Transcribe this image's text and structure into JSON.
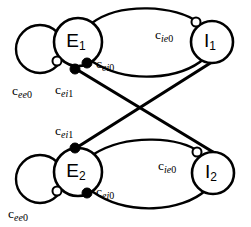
{
  "figure": {
    "background_color": "#ffffff",
    "stroke_color": "#000000",
    "width": 251,
    "height": 227
  },
  "nodes": [
    {
      "id": "E1",
      "base": "E",
      "subscript": "1",
      "cx": 78,
      "cy": 42,
      "r": 24,
      "type": "excitatory"
    },
    {
      "id": "I1",
      "base": "I",
      "subscript": "1",
      "cx": 212,
      "cy": 42,
      "r": 21,
      "type": "inhibitory"
    },
    {
      "id": "E2",
      "base": "E",
      "subscript": "2",
      "cx": 78,
      "cy": 172,
      "r": 24,
      "type": "excitatory"
    },
    {
      "id": "I2",
      "base": "I",
      "subscript": "2",
      "cx": 213,
      "cy": 173,
      "r": 21,
      "type": "inhibitory"
    }
  ],
  "edge_labels": [
    {
      "id": "cee0-top",
      "base": "c",
      "italic_sub": "ee",
      "num_sub": "0",
      "x": 12,
      "y": 95,
      "for": "E1-self-loop"
    },
    {
      "id": "cei0-top",
      "base": "c",
      "italic_sub": "ei",
      "num_sub": "0",
      "x": 96,
      "y": 68,
      "for": "E1-to-I1"
    },
    {
      "id": "cei1-top",
      "base": "c",
      "italic_sub": "ei",
      "num_sub": "1",
      "x": 55,
      "y": 94,
      "for": "E1-to-I2"
    },
    {
      "id": "cie0-top",
      "base": "c",
      "italic_sub": "ie",
      "num_sub": "0",
      "x": 155,
      "y": 39,
      "for": "I1-to-E1"
    },
    {
      "id": "cei1-bot",
      "base": "c",
      "italic_sub": "ei",
      "num_sub": "1",
      "x": 55,
      "y": 135,
      "for": "E2-to-I1"
    },
    {
      "id": "cee0-bot",
      "base": "c",
      "italic_sub": "ee",
      "num_sub": "0",
      "x": 8,
      "y": 218,
      "for": "E2-self-loop"
    },
    {
      "id": "cei0-bot",
      "base": "c",
      "italic_sub": "ei",
      "num_sub": "0",
      "x": 96,
      "y": 196,
      "for": "E2-to-I2"
    },
    {
      "id": "cie0-bot",
      "base": "c",
      "italic_sub": "ie",
      "num_sub": "0",
      "x": 158,
      "y": 170,
      "for": "I2-to-E2"
    }
  ],
  "synapses": [
    {
      "id": "syn-ee0-top",
      "kind": "open",
      "cx": 57,
      "cy": 61,
      "r": 4.5,
      "label": "cee0-top"
    },
    {
      "id": "syn-ei0-top",
      "kind": "closed",
      "cx": 87,
      "cy": 63,
      "r": 5.0,
      "label": "cei0-top"
    },
    {
      "id": "syn-ei1-top",
      "kind": "closed",
      "cx": 75,
      "cy": 69,
      "r": 5.0,
      "label": "cei1-top"
    },
    {
      "id": "syn-ie0-top",
      "kind": "open",
      "cx": 196,
      "cy": 22,
      "r": 4.5,
      "label": "cie0-top"
    },
    {
      "id": "syn-ei1-bot",
      "kind": "closed",
      "cx": 75,
      "cy": 148,
      "r": 5.0,
      "label": "cei1-bot"
    },
    {
      "id": "syn-ee0-bot",
      "kind": "open",
      "cx": 57,
      "cy": 191,
      "r": 4.5,
      "label": "cee0-bot"
    },
    {
      "id": "syn-ei0-bot",
      "kind": "closed",
      "cx": 87,
      "cy": 193,
      "r": 5.0,
      "label": "cei0-bot"
    },
    {
      "id": "syn-ie0-bot",
      "kind": "open",
      "cx": 197,
      "cy": 152,
      "r": 4.5,
      "label": "cie0-bot"
    }
  ],
  "connections": [
    {
      "id": "e1-self",
      "from": "E1",
      "to": "E1",
      "style": "self-loop",
      "synapse": "syn-ee0-top"
    },
    {
      "id": "e1-to-i1",
      "from": "E1",
      "to": "I1",
      "style": "arc-upper",
      "synapse": "syn-ei0-top"
    },
    {
      "id": "i1-to-e1",
      "from": "I1",
      "to": "E1",
      "style": "arc-lower",
      "synapse": "syn-ie0-top"
    },
    {
      "id": "e1-to-i2",
      "from": "E1",
      "to": "I2",
      "style": "straight",
      "synapse": "syn-ei1-top"
    },
    {
      "id": "e2-self",
      "from": "E2",
      "to": "E2",
      "style": "self-loop",
      "synapse": "syn-ee0-bot"
    },
    {
      "id": "e2-to-i2",
      "from": "E2",
      "to": "I2",
      "style": "arc-lower",
      "synapse": "syn-ei0-bot"
    },
    {
      "id": "i2-to-e2",
      "from": "I2",
      "to": "E2",
      "style": "arc-upper",
      "synapse": "syn-ie0-bot"
    },
    {
      "id": "e2-to-i1",
      "from": "E2",
      "to": "I1",
      "style": "straight",
      "synapse": "syn-ei1-bot"
    }
  ],
  "loops": [
    {
      "id": "loop-e1",
      "cx": 40,
      "cy": 49,
      "r": 24
    },
    {
      "id": "loop-e2",
      "cx": 40,
      "cy": 179,
      "r": 24
    }
  ]
}
